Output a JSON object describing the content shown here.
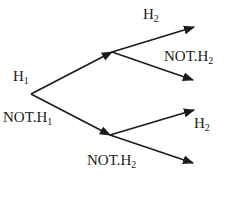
{
  "diagram": {
    "type": "probability-tree",
    "root": {
      "x": 31,
      "y": 94
    },
    "level1": [
      {
        "id": "H1",
        "label": "H",
        "sub": "1",
        "to": {
          "x": 112,
          "y": 52
        },
        "label_pos": {
          "x": 13,
          "y": 81
        }
      },
      {
        "id": "NOT.H1",
        "label": "NOT.H",
        "sub": "1",
        "to": {
          "x": 110,
          "y": 135
        },
        "label_pos": {
          "x": 3,
          "y": 122
        }
      }
    ],
    "level2": [
      {
        "parent": "H1",
        "label": "H",
        "sub": "2",
        "from": {
          "x": 112,
          "y": 52
        },
        "to": {
          "x": 194,
          "y": 27
        },
        "label_pos": {
          "x": 143,
          "y": 19
        }
      },
      {
        "parent": "H1",
        "label": "NOT.H",
        "sub": "2",
        "from": {
          "x": 112,
          "y": 52
        },
        "to": {
          "x": 193,
          "y": 80
        },
        "label_pos": {
          "x": 164,
          "y": 61
        }
      },
      {
        "parent": "NOT.H1",
        "label": "H",
        "sub": "2",
        "from": {
          "x": 110,
          "y": 135
        },
        "to": {
          "x": 194,
          "y": 110
        },
        "label_pos": {
          "x": 194,
          "y": 128
        }
      },
      {
        "parent": "NOT.H1",
        "label": "NOT.H",
        "sub": "2",
        "from": {
          "x": 110,
          "y": 135
        },
        "to": {
          "x": 193,
          "y": 163
        },
        "label_pos": {
          "x": 87,
          "y": 165
        }
      }
    ],
    "colors": {
      "stroke": "#1a1a1a",
      "background": "#ffffff"
    }
  }
}
